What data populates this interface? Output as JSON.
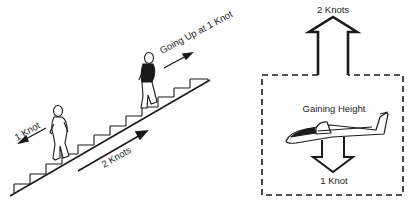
{
  "left_panel": {
    "caption_top": "Going Up at 1 Knot",
    "caption_down": "1 Knot",
    "caption_escalator": "2 Knots",
    "steps": 13
  },
  "right_panel": {
    "label_up": "2 Knots",
    "label_center": "Gaining Height",
    "label_down": "1 Knot"
  },
  "colors": {
    "ink": "#1a1a1a",
    "background": "#ffffff"
  }
}
